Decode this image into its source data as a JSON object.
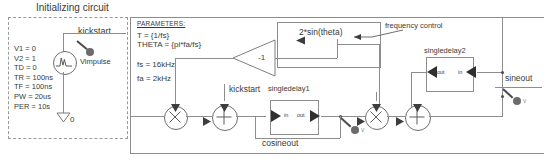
{
  "diagram": {
    "title": "Initializing circuit",
    "ground_label": "0"
  },
  "init_circuit": {
    "source": {
      "name": "Vimpulse",
      "kickstart_label": "kickstart"
    },
    "spice_params": [
      "V1 = 0",
      "V2 = 1",
      "TD = 0",
      "TR = 100ns",
      "TF = 100ns",
      "PW = 20us",
      "PER = 10s"
    ]
  },
  "parameters_block": {
    "heading": "PARAMETERS:",
    "lines": [
      "T = {1/fs}",
      "THETA = {pi*fa/fs}"
    ],
    "values": [
      "fs = 16kHz",
      "fa = 2kHz"
    ]
  },
  "blocks": {
    "gain": {
      "label": "-1"
    },
    "sine_expr": "2*sin(theta)",
    "frequency_control": "frequency control",
    "singledelay1": {
      "title": "singledelay1",
      "port_in": "in",
      "port_out": "out"
    },
    "singledelay2": {
      "title": "singledelay2",
      "port_in": "in",
      "port_out": "out"
    },
    "kickstart_mid": "kickstart"
  },
  "nets": {
    "cosineout": "cosineout",
    "sineout": "sineout"
  },
  "probes": {
    "marker": "V"
  },
  "colors": {
    "wire": "#8d8d8d",
    "text": "#3a3a3a",
    "node_stroke": "#6e6e6e",
    "dash_border": "#9a9a9a"
  }
}
